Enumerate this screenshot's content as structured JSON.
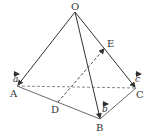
{
  "diagram": {
    "type": "tetrahedron-vectors",
    "points": {
      "O": {
        "label": "O",
        "x": 75,
        "y": 12
      },
      "A": {
        "label": "A",
        "x": 17,
        "y": 86
      },
      "B": {
        "label": "B",
        "x": 100,
        "y": 119
      },
      "C": {
        "label": "C",
        "x": 136,
        "y": 88
      },
      "D": {
        "label": "D",
        "x": 58,
        "y": 102
      },
      "E": {
        "label": "E",
        "x": 105,
        "y": 48
      }
    },
    "vectors": {
      "a": {
        "label": "a",
        "from": "O",
        "to": "A"
      },
      "b": {
        "label": "b",
        "from": "O",
        "to": "B"
      },
      "c": {
        "label": "c",
        "from": "O",
        "to": "C"
      },
      "DE": {
        "label": "",
        "from": "D",
        "to": "E",
        "dashed": true
      }
    },
    "edges": [
      {
        "from": "A",
        "to": "B",
        "style": "solid"
      },
      {
        "from": "B",
        "to": "C",
        "style": "solid"
      },
      {
        "from": "A",
        "to": "C",
        "style": "dashed"
      }
    ],
    "colors": {
      "line": "#333333",
      "background": "#ffffff"
    }
  }
}
